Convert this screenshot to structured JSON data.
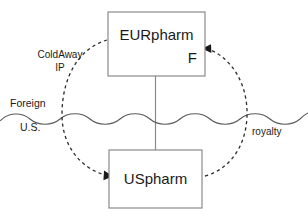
{
  "diagram": {
    "entities": [
      {
        "id": "eurpharm",
        "name": "EURpharm",
        "sublabel": "F",
        "region": "Foreign"
      },
      {
        "id": "uspharm",
        "name": "USpharm",
        "sublabel": "",
        "region": "U.S."
      }
    ],
    "border": {
      "above_label": "Foreign",
      "below_label": "U.S.",
      "style": "wavy-line"
    },
    "flows": [
      {
        "id": "ip-license",
        "label_line1": "ColdAway",
        "label_line2": "IP",
        "from": "EURpharm",
        "to": "USpharm",
        "style": "dashed-arrow"
      },
      {
        "id": "royalty",
        "label_line1": "royalty",
        "label_line2": "",
        "from": "USpharm",
        "to": "EURpharm",
        "style": "dashed-arrow"
      }
    ],
    "ownership_link": {
      "from": "EURpharm",
      "to": "USpharm",
      "style": "solid-line"
    },
    "colors": {
      "box_stroke": "#8a8a8a",
      "text": "#1a1a1a",
      "flow_stroke": "#2b2b2b",
      "border_stroke": "#5a5a5a",
      "background": "#ffffff"
    }
  }
}
